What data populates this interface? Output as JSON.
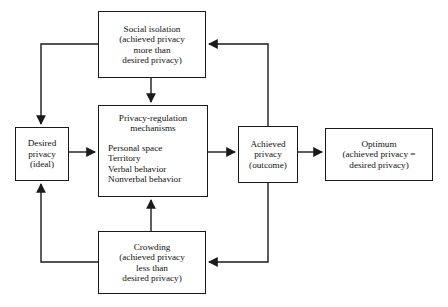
{
  "diagram": {
    "stroke_color": "#1a1a1a",
    "background_color": "#ffffff",
    "nodes": {
      "social_isolation": {
        "lines": [
          "Social isolation",
          "(achieved privacy",
          "more than",
          "desired privacy)"
        ]
      },
      "desired_privacy": {
        "lines": [
          "Desired",
          "privacy",
          "(ideal)"
        ]
      },
      "privacy_mechanisms": {
        "heading": [
          "Privacy-regulation",
          "mechanisms"
        ],
        "items": [
          "Personal space",
          "Territory",
          "Verbal behavior",
          "Nonverbal behavior"
        ]
      },
      "achieved_privacy": {
        "lines": [
          "Achieved",
          "privacy",
          "(outcome)"
        ]
      },
      "optimum": {
        "lines": [
          "Optimum",
          "(achieved privacy =",
          "desired privacy)"
        ]
      },
      "crowding": {
        "lines": [
          "Crowding",
          "(achieved privacy",
          "less than",
          "desired privacy)"
        ]
      }
    },
    "edges": [
      {
        "name": "desired-privacy-to-mechanisms",
        "from": "desired_privacy",
        "to": "privacy_mechanisms"
      },
      {
        "name": "mechanisms-to-achieved-privacy",
        "from": "privacy_mechanisms",
        "to": "achieved_privacy"
      },
      {
        "name": "achieved-privacy-to-optimum",
        "from": "achieved_privacy",
        "to": "optimum"
      },
      {
        "name": "social-isolation-to-mechanisms",
        "from": "social_isolation",
        "to": "privacy_mechanisms"
      },
      {
        "name": "crowding-to-mechanisms",
        "from": "crowding",
        "to": "privacy_mechanisms"
      },
      {
        "name": "achieved-privacy-to-social-isolation",
        "from": "achieved_privacy",
        "to": "social_isolation"
      },
      {
        "name": "achieved-privacy-to-crowding",
        "from": "achieved_privacy",
        "to": "crowding"
      },
      {
        "name": "social-isolation-to-desired-privacy",
        "from": "social_isolation",
        "to": "desired_privacy"
      },
      {
        "name": "crowding-to-desired-privacy",
        "from": "crowding",
        "to": "desired_privacy"
      }
    ]
  }
}
